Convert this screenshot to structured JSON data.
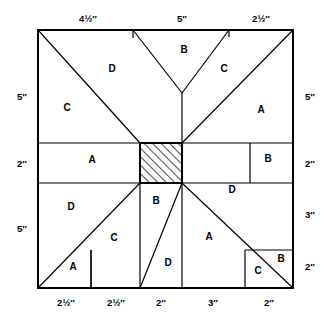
{
  "figure": {
    "type": "quilt-block-piecing-diagram",
    "shape": "square",
    "hatched_region_label": "center-square",
    "line_color": "#000000",
    "background_color": "#ffffff"
  },
  "dimensions": {
    "top": [
      {
        "id": "top-1",
        "text": "4½″"
      },
      {
        "id": "top-2",
        "text": "5″"
      },
      {
        "id": "top-3",
        "text": "2½″"
      }
    ],
    "bottom": [
      {
        "id": "bottom-1",
        "text": "2½″"
      },
      {
        "id": "bottom-2",
        "text": "2½″"
      },
      {
        "id": "bottom-3",
        "text": "2″"
      },
      {
        "id": "bottom-4",
        "text": "3″"
      },
      {
        "id": "bottom-5",
        "text": "2″"
      }
    ],
    "left": [
      {
        "id": "left-1",
        "text": "5″"
      },
      {
        "id": "left-2",
        "text": "2″"
      },
      {
        "id": "left-3",
        "text": "5″"
      }
    ],
    "right": [
      {
        "id": "right-1",
        "text": "5″"
      },
      {
        "id": "right-2",
        "text": "2″"
      },
      {
        "id": "right-3",
        "text": "3″"
      },
      {
        "id": "right-4",
        "text": "2″"
      }
    ]
  },
  "pieces": [
    {
      "id": "p01",
      "text": "D",
      "x": 112,
      "y": 72
    },
    {
      "id": "p02",
      "text": "B",
      "x": 184,
      "y": 53
    },
    {
      "id": "p03",
      "text": "C",
      "x": 224,
      "y": 72
    },
    {
      "id": "p04",
      "text": "C",
      "x": 67,
      "y": 111
    },
    {
      "id": "p05",
      "text": "A",
      "x": 261,
      "y": 113
    },
    {
      "id": "p06",
      "text": "A",
      "x": 92,
      "y": 163
    },
    {
      "id": "p07",
      "text": "B",
      "x": 268,
      "y": 162
    },
    {
      "id": "p08",
      "text": "D",
      "x": 232,
      "y": 193
    },
    {
      "id": "p09",
      "text": "D",
      "x": 71,
      "y": 210
    },
    {
      "id": "p10",
      "text": "B",
      "x": 156,
      "y": 204
    },
    {
      "id": "p11",
      "text": "C",
      "x": 114,
      "y": 241
    },
    {
      "id": "p12",
      "text": "A",
      "x": 209,
      "y": 240
    },
    {
      "id": "p13",
      "text": "D",
      "x": 168,
      "y": 266
    },
    {
      "id": "p14",
      "text": "A",
      "x": 73,
      "y": 270
    },
    {
      "id": "p15",
      "text": "C",
      "x": 258,
      "y": 274
    },
    {
      "id": "p16",
      "text": "B",
      "x": 281,
      "y": 262
    }
  ]
}
